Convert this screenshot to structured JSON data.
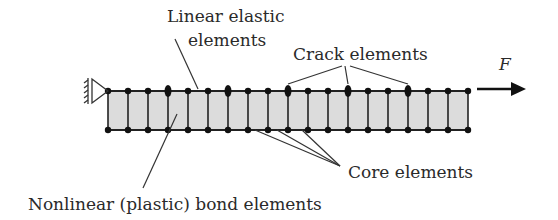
{
  "labels": {
    "linear_elastic_line1": "Linear elastic",
    "linear_elastic_line2": "elements",
    "crack": "Crack elements",
    "force": "F",
    "core": "Core elements",
    "bond": "Nonlinear (plastic) bond elements"
  },
  "beam": {
    "node_count": 19,
    "x_start": 108,
    "spacing": 20,
    "top_y": 91,
    "bottom_y": 130,
    "crack_node_indices": [
      3,
      6,
      9,
      12,
      15
    ],
    "fill_color": "#dcdcdc",
    "line_color": "#222222"
  }
}
